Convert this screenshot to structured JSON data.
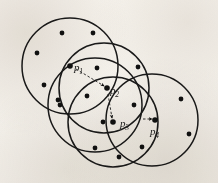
{
  "figure": {
    "background_color": "#f7f5f1",
    "stroke_color": "#1a1a1a",
    "dot_color": "#111111",
    "arrow_style": "dashed",
    "width": 218,
    "height": 183
  },
  "circles": [
    {
      "id": "circle-1",
      "cx": 70,
      "cy": 66,
      "r": 48
    },
    {
      "id": "circle-2",
      "cx": 104,
      "cy": 88,
      "r": 45
    },
    {
      "id": "circle-3",
      "cx": 113,
      "cy": 122,
      "r": 45
    },
    {
      "id": "circle-4",
      "cx": 152,
      "cy": 120,
      "r": 46
    },
    {
      "id": "circle-5",
      "cx": 95,
      "cy": 105,
      "r": 47
    }
  ],
  "points": [
    {
      "id": "p1",
      "label": "p",
      "sub": "1",
      "x": 70,
      "y": 66,
      "label_x": 74,
      "label_y": 62
    },
    {
      "id": "p2",
      "label": "p",
      "sub": "2",
      "x": 107,
      "y": 88,
      "label_x": 110,
      "label_y": 85
    },
    {
      "id": "p3",
      "label": "p",
      "sub": "3",
      "x": 113,
      "y": 122,
      "label_x": 120,
      "label_y": 118
    },
    {
      "id": "p4",
      "label": "p",
      "sub": "4",
      "x": 155,
      "y": 120,
      "label_x": 150,
      "label_y": 126
    }
  ],
  "arrows": [
    {
      "id": "arrow-p1-p2",
      "x1": 76,
      "y1": 69,
      "x2": 104,
      "y2": 86
    },
    {
      "id": "arrow-p2-p3",
      "x1": 108,
      "y1": 94,
      "x2": 112,
      "y2": 118
    },
    {
      "id": "arrow-p3-p4",
      "x1": 143,
      "y1": 119,
      "x2": 152,
      "y2": 119
    }
  ],
  "data_dots": [
    {
      "x": 62,
      "y": 33
    },
    {
      "x": 93,
      "y": 33
    },
    {
      "x": 37,
      "y": 53
    },
    {
      "x": 97,
      "y": 68
    },
    {
      "x": 138,
      "y": 67
    },
    {
      "x": 44,
      "y": 85
    },
    {
      "x": 87,
      "y": 96
    },
    {
      "x": 58,
      "y": 100
    },
    {
      "x": 60,
      "y": 105
    },
    {
      "x": 134,
      "y": 105
    },
    {
      "x": 181,
      "y": 99
    },
    {
      "x": 103,
      "y": 122
    },
    {
      "x": 189,
      "y": 134
    },
    {
      "x": 95,
      "y": 148
    },
    {
      "x": 142,
      "y": 147
    },
    {
      "x": 119,
      "y": 157
    }
  ]
}
